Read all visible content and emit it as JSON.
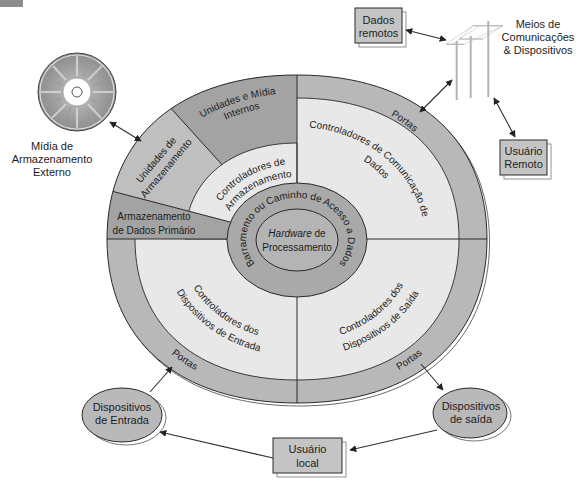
{
  "diagram": {
    "core": {
      "italic_word": "Hardware",
      "line1_rest": " de",
      "line2": "Processamento"
    },
    "bus_label": "Barramento ou Caminho de Acesso a Dados",
    "internal_drives": {
      "line1": "Unidades e Mídia",
      "line2": "Internos"
    },
    "storage_drives": {
      "line1": "Unidades de",
      "line2": "Armazenamento"
    },
    "primary_storage": {
      "line1": "Armazenamento",
      "line2": "de Dados Primário"
    },
    "storage_controllers": {
      "line1": "Controladores de",
      "line2": "Armazenamento"
    },
    "comm_controllers": {
      "line1": "Controladores de Comunicação de",
      "line2": "Dados"
    },
    "input_controllers": {
      "line1": "Controladores dos",
      "line2": "Dispositivos de Entrada"
    },
    "output_controllers": {
      "line1": "Controladores dos",
      "line2": "Dispositivos de Saída"
    },
    "ports": {
      "top_right": "Portas",
      "bottom_left": "Portas",
      "bottom_right": "Portas"
    }
  },
  "external": {
    "external_media": {
      "line1": "Mídia de",
      "line2": "Armazenamento",
      "line3": "Externo"
    },
    "comm_media": {
      "line1": "Meios de",
      "line2": "Comunicações",
      "line3": "& Dispositivos"
    },
    "remote_data": {
      "line1": "Dados",
      "line2": "remotos"
    },
    "remote_user": {
      "line1": "Usuário",
      "line2": "Remoto"
    },
    "input_devices": {
      "line1": "Dispositivos",
      "line2": "de Entrada"
    },
    "output_devices": {
      "line1": "Dispositivos",
      "line2": "de saída"
    },
    "local_user": {
      "line1": "Usuário",
      "line2": "local"
    }
  },
  "colors": {
    "ports_ring": "#b8b8b8",
    "storage_drives": "#bfbfbf",
    "dark_segment": "#a3a3a3",
    "light_segment": "#e8e8e8",
    "bus_ring": "#a9a9a9",
    "core": "#b4b4b4",
    "box_fill": "#c4c4c4",
    "device_fill": "#b9b9b9"
  }
}
